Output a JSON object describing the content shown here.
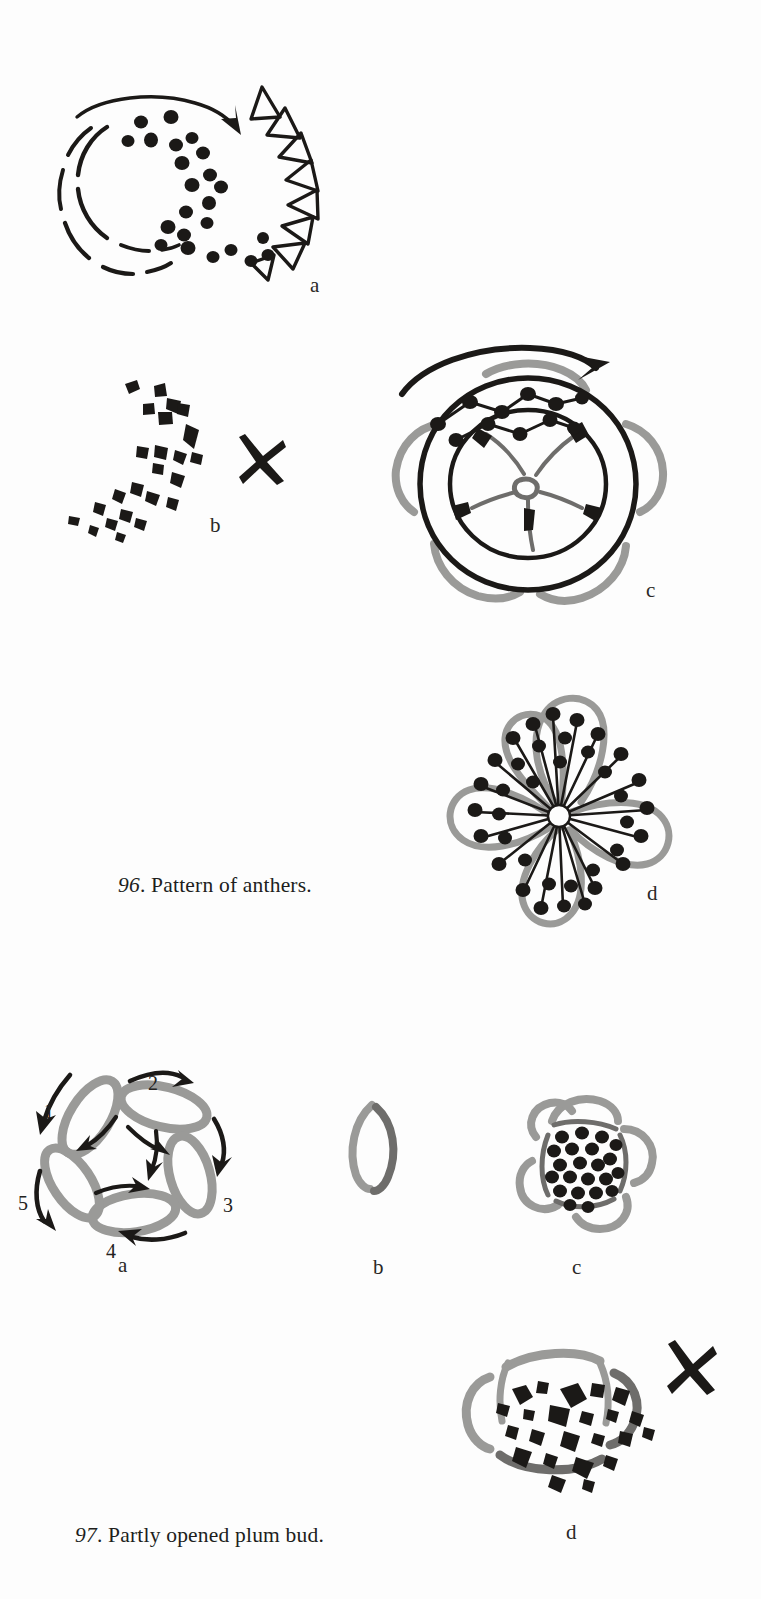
{
  "page": {
    "background_color": "#fdfdfd",
    "ink_color": "#1b1917",
    "gray_color": "#9a9a98",
    "width": 761,
    "height": 1599
  },
  "figures": [
    {
      "id": "figure-96",
      "caption_number": "96",
      "caption_text": ". Pattern of anthers.",
      "caption_full": "96. Pattern of anthers.",
      "panels": [
        {
          "key": "a",
          "label": "a",
          "description": "dashed circle of anther dots with sweeping arrow and row of open triangles",
          "has_x_mark": false
        },
        {
          "key": "b",
          "label": "b",
          "description": "loose scatter of dark triangular anther strokes",
          "has_x_mark": true
        },
        {
          "key": "c",
          "label": "c",
          "description": "concentric rings with radiating stamens and curved directional arrow",
          "has_x_mark": false
        },
        {
          "key": "d",
          "label": "d",
          "description": "five petal blossom with radiating stamens tipped by dark anthers",
          "has_x_mark": false
        }
      ]
    },
    {
      "id": "figure-97",
      "caption_number": "97",
      "caption_text": ". Partly opened plum bud.",
      "caption_full": "97. Partly opened plum bud.",
      "panels": [
        {
          "key": "a",
          "label": "a",
          "description": "five gray petal outlines with numbered brush stroke order arrows",
          "has_x_mark": false,
          "stroke_numbers": [
            "1",
            "2",
            "3",
            "4",
            "5"
          ]
        },
        {
          "key": "b",
          "label": "b",
          "description": "single gray petal outline stroke",
          "has_x_mark": false
        },
        {
          "key": "c",
          "label": "c",
          "description": "bud of gray petals filled with dense black anther dots",
          "has_x_mark": false
        },
        {
          "key": "d",
          "label": "d",
          "description": "flattened bud with irregular heavy black blobs",
          "has_x_mark": true
        }
      ]
    }
  ],
  "marks": {
    "x_mark_name": "cross-out-mark",
    "x_mark_meaning": "incorrect example"
  }
}
